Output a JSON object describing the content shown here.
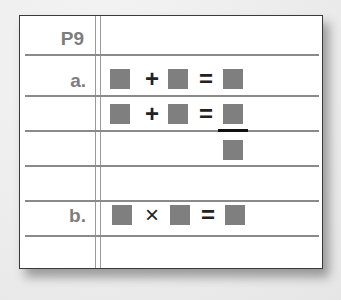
{
  "worksheet": {
    "header": "P9",
    "rows": [
      {
        "label": "a.",
        "expression": {
          "left": "box",
          "operator": "+",
          "middle": "box",
          "equals": "=",
          "right": "box"
        }
      },
      {
        "label": "",
        "expression": {
          "left": "box",
          "operator": "+",
          "middle": "box",
          "equals": "=",
          "right": "fraction(box/box)"
        }
      },
      {
        "label": "",
        "expression": null
      },
      {
        "label": "b.",
        "expression": {
          "left": "box",
          "operator": "×",
          "middle": "box",
          "equals": "=",
          "right": "box"
        }
      },
      {
        "label": "",
        "expression": null
      }
    ],
    "ops": {
      "plus": "+",
      "times": "×",
      "equals": "="
    },
    "colors": {
      "box": "#7f7f7f",
      "label": "#7d7d7d",
      "rule": "#8a8a8a",
      "border": "#3a3a3a"
    }
  }
}
